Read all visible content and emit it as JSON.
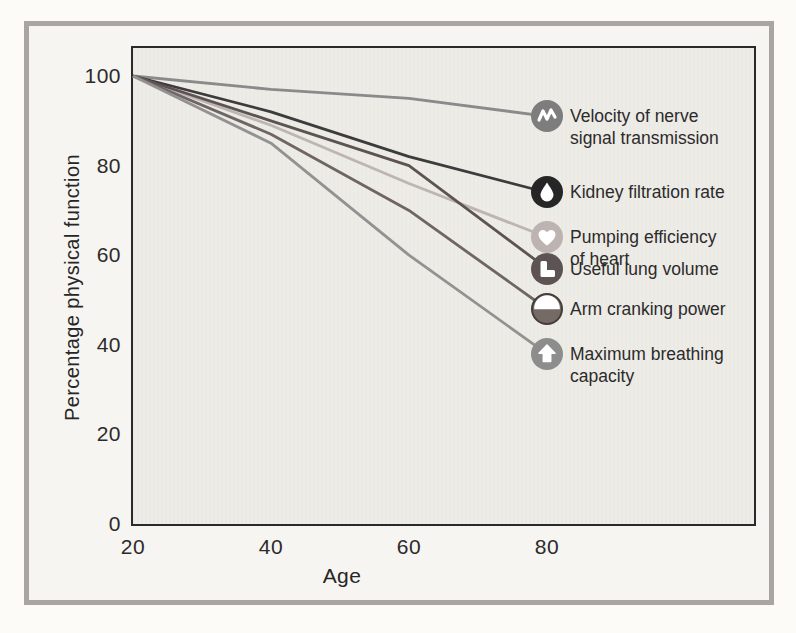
{
  "figure": {
    "y_axis_title": "Percentage physical function",
    "x_axis_title": "Age"
  },
  "colors": {
    "outer_frame": "#a9a5a0",
    "paper": "#f7f5f1",
    "plot_background": "#eeece7",
    "plot_border": "#2a2a2a",
    "text": "#2b2b2b",
    "icon_glyph": "#ffffff"
  },
  "chart_data": {
    "type": "line",
    "title": "",
    "xlabel": "Age",
    "ylabel": "Percentage physical function",
    "x": [
      20,
      40,
      60,
      80
    ],
    "xlim": [
      20,
      90
    ],
    "ylim": [
      0,
      105
    ],
    "grid": false,
    "legend_position": "right-of-lines, icons attached to line ends",
    "xtick_labels": [
      "20",
      "40",
      "60",
      "80"
    ],
    "ytick_labels": [
      "100",
      "80",
      "60",
      "40",
      "20",
      "0"
    ],
    "series": [
      {
        "id": "nerve",
        "name": "Velocity of nerve signal transmission",
        "label_lines": [
          "Velocity of nerve",
          "signal transmission"
        ],
        "icon": "nerve-wave-icon",
        "color": "#8a8a8a",
        "icon_bg": "#7d7d7d",
        "values": [
          100,
          97,
          95,
          91
        ]
      },
      {
        "id": "kidney",
        "name": "Kidney filtration rate",
        "label_lines": [
          "Kidney filtration rate"
        ],
        "icon": "droplet-icon",
        "color": "#3c3c3c",
        "icon_bg": "#262626",
        "values": [
          100,
          92,
          82,
          74
        ]
      },
      {
        "id": "heart",
        "name": "Pumping efficiency of heart",
        "label_lines": [
          "Pumping efficiency",
          "of heart"
        ],
        "icon": "heart-icon",
        "color": "#bdb5b2",
        "icon_bg": "#bdb3b0",
        "values": [
          100,
          89,
          76,
          64
        ]
      },
      {
        "id": "lung",
        "name": "Useful lung volume",
        "label_lines": [
          "Useful lung volume"
        ],
        "icon": "lung-icon",
        "color": "#5d5353",
        "icon_bg": "#5d5353",
        "values": [
          100,
          90,
          80,
          57
        ]
      },
      {
        "id": "arm",
        "name": "Arm cranking power",
        "label_lines": [
          "Arm cranking power"
        ],
        "icon": "arm-icon",
        "color": "#6f6563",
        "icon_bg": "#756a66",
        "icon_ring": "#453d38",
        "values": [
          100,
          87,
          70,
          48
        ]
      },
      {
        "id": "breathing",
        "name": "Maximum breathing capacity",
        "label_lines": [
          "Maximum breathing",
          "capacity"
        ],
        "icon": "breathing-arrow-icon",
        "color": "#929292",
        "icon_bg": "#8d8d8d",
        "values": [
          100,
          85,
          60,
          38
        ]
      }
    ]
  }
}
